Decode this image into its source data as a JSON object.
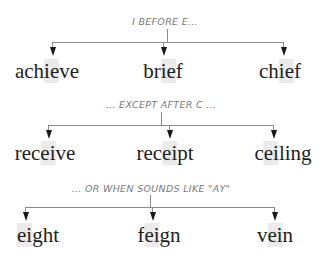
{
  "title": "I before E",
  "groups": [
    {
      "label": "I BEFORE E...",
      "words": [
        {
          "pre": "ach",
          "hl": "ie",
          "post": "ve"
        },
        {
          "pre": "br",
          "hl": "ie",
          "post": "f"
        },
        {
          "pre": "ch",
          "hl": "ie",
          "post": "f"
        }
      ]
    },
    {
      "label": "... EXCEPT AFTER C ...",
      "words": [
        {
          "pre": "rec",
          "hl": "ei",
          "post": "ve"
        },
        {
          "pre": "rec",
          "hl": "ei",
          "post": "pt"
        },
        {
          "pre": "c",
          "hl": "ei",
          "post": "ling"
        }
      ]
    },
    {
      "label": "... OR WHEN SOUNDS LIKE \"AY\"",
      "words": [
        {
          "pre": "",
          "hl": "ei",
          "post": "ght"
        },
        {
          "pre": "f",
          "hl": "ei",
          "post": "gn"
        },
        {
          "pre": "v",
          "hl": "ei",
          "post": "n"
        }
      ]
    }
  ]
}
